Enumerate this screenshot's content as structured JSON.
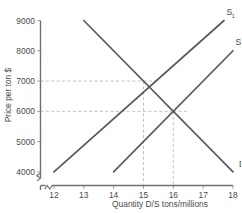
{
  "chart_data": {
    "type": "line",
    "title": "",
    "xlabel": "Quantity D/S tons/millions",
    "ylabel": "Price per ton $",
    "xlim": [
      11.55,
      18
    ],
    "ylim": [
      3550,
      9000
    ],
    "x_ticks": [
      "12",
      "13",
      "14",
      "15",
      "16",
      "17",
      "18"
    ],
    "x_tick_values": [
      12,
      13,
      14,
      15,
      16,
      17,
      18
    ],
    "y_ticks": [
      "4000",
      "5000",
      "6000",
      "7000",
      "8000",
      "9000"
    ],
    "y_tick_values": [
      4000,
      5000,
      6000,
      7000,
      8000,
      9000
    ],
    "axis_break_x": true,
    "axis_break_y": true,
    "grid": false,
    "legend_position": "inline-curve-labels",
    "series": [
      {
        "name": "D",
        "label": "D",
        "label_sub": "",
        "role": "demand",
        "points": [
          [
            13,
            9000
          ],
          [
            18,
            4000
          ]
        ]
      },
      {
        "name": "S1",
        "label": "S",
        "label_sub": "1",
        "role": "supply",
        "points": [
          [
            12,
            4000
          ],
          [
            17.7,
            9000
          ]
        ]
      },
      {
        "name": "S2",
        "label": "S",
        "label_sub": "2",
        "role": "supply",
        "points": [
          [
            14,
            4000
          ],
          [
            18,
            8000
          ]
        ]
      }
    ],
    "annotations": [
      {
        "name": "equilibrium-1",
        "x": 15,
        "y": 7000,
        "guide_h": true,
        "guide_v": true
      },
      {
        "name": "equilibrium-2",
        "x": 16,
        "y": 6000,
        "guide_h": true,
        "guide_v": true
      }
    ],
    "colors": {
      "background": "#ffffff",
      "curve": "#5a5a5a",
      "axis": "#6f6f6f",
      "guide": "#b9b9b9",
      "text": "#4a4a4a"
    }
  }
}
